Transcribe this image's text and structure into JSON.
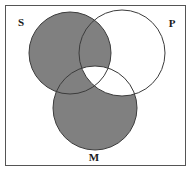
{
  "figure": {
    "type": "venn-diagram",
    "sets": 3,
    "background_color": "#ffffff",
    "frame": {
      "stroke_color": "#555555",
      "fill_color": "#ffffff",
      "x": 5,
      "y": 5,
      "width": 181,
      "height": 161
    },
    "shade_color": "#808080",
    "unshaded_color": "#ffffff",
    "circle_stroke_color": "#3c3c3c",
    "circles": [
      {
        "id": "S",
        "label": "S",
        "cx": 70,
        "cy": 53,
        "r": 41,
        "label_x": 21,
        "label_y": 23
      },
      {
        "id": "P",
        "label": "P",
        "cx": 122,
        "cy": 53,
        "r": 43,
        "label_x": 172,
        "label_y": 24
      },
      {
        "id": "M",
        "label": "M",
        "cx": 95,
        "cy": 108,
        "r": 42,
        "label_x": 94,
        "label_y": 158
      }
    ],
    "regions": [
      {
        "id": "S-only",
        "name": "S only",
        "shaded": true
      },
      {
        "id": "P-only",
        "name": "P only",
        "shaded": false
      },
      {
        "id": "M-only",
        "name": "M only",
        "shaded": true
      },
      {
        "id": "S-and-P",
        "name": "S and P not M",
        "shaded": true
      },
      {
        "id": "S-and-M",
        "name": "S and M not P",
        "shaded": true
      },
      {
        "id": "P-and-M",
        "name": "P and M not S",
        "shaded": false
      },
      {
        "id": "S-P-M",
        "name": "S and P and M",
        "shaded": false
      }
    ]
  }
}
